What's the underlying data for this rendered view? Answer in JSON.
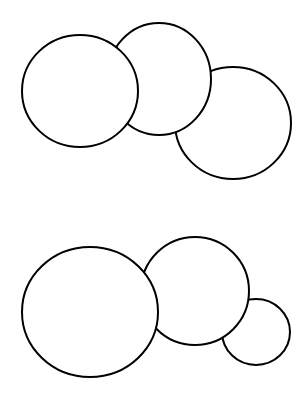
{
  "canvas": {
    "width": 305,
    "height": 404,
    "background": "#ffffff"
  },
  "style": {
    "stroke": "#000000",
    "stroke_width": 2,
    "fill": "#ffffff"
  },
  "groups": [
    {
      "name": "top-group",
      "circles_back_to_front": [
        {
          "id": "top-right",
          "cx": 233,
          "cy": 123,
          "rx": 58,
          "ry": 56
        },
        {
          "id": "top-middle",
          "cx": 159,
          "cy": 79,
          "rx": 52,
          "ry": 56
        },
        {
          "id": "top-left",
          "cx": 80,
          "cy": 91,
          "rx": 58,
          "ry": 56
        }
      ]
    },
    {
      "name": "bottom-group",
      "circles_back_to_front": [
        {
          "id": "bottom-small",
          "cx": 256,
          "cy": 332,
          "rx": 34,
          "ry": 33
        },
        {
          "id": "bottom-middle",
          "cx": 195,
          "cy": 291,
          "rx": 54,
          "ry": 54
        },
        {
          "id": "bottom-large",
          "cx": 90,
          "cy": 312,
          "rx": 68,
          "ry": 65
        }
      ]
    }
  ]
}
